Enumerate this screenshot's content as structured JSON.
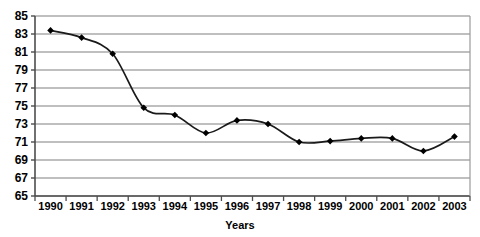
{
  "chart_data": {
    "type": "line",
    "title": "",
    "subtitle": "",
    "xlabel": "Years",
    "ylabel": "",
    "categories": [
      "1990",
      "1991",
      "1992",
      "1993",
      "1994",
      "1995",
      "1996",
      "1997",
      "1998",
      "1999",
      "2000",
      "2001",
      "2002",
      "2003"
    ],
    "values": [
      83.4,
      82.6,
      80.8,
      74.8,
      74.0,
      72.0,
      73.4,
      73.0,
      71.0,
      71.1,
      71.4,
      71.4,
      70.0,
      71.6
    ],
    "series": [
      {
        "name": "series-1",
        "values": [
          83.4,
          82.6,
          80.8,
          74.8,
          74.0,
          72.0,
          73.4,
          73.0,
          71.0,
          71.1,
          71.4,
          71.4,
          70.0,
          71.6
        ]
      }
    ],
    "ylim": [
      65,
      85
    ],
    "ytick_labels": [
      "65",
      "67",
      "69",
      "71",
      "73",
      "75",
      "77",
      "79",
      "81",
      "83",
      "85"
    ],
    "ytick_values": [
      65,
      67,
      69,
      71,
      73,
      75,
      77,
      79,
      81,
      83,
      85
    ],
    "xtick_labels": [
      "1990",
      "1991",
      "1992",
      "1993",
      "1994",
      "1995",
      "1996",
      "1997",
      "1998",
      "1999",
      "2000",
      "2001",
      "2002",
      "2003"
    ],
    "grid": true,
    "grid_axis": "y",
    "legend": false,
    "legend_position": "none",
    "marker": "diamond",
    "line_color": "#1a1a1a",
    "marker_color": "#000000",
    "grid_color": "#808080",
    "axis_color": "#4d4d4d",
    "background_color": "#ffffff",
    "annotations": []
  }
}
